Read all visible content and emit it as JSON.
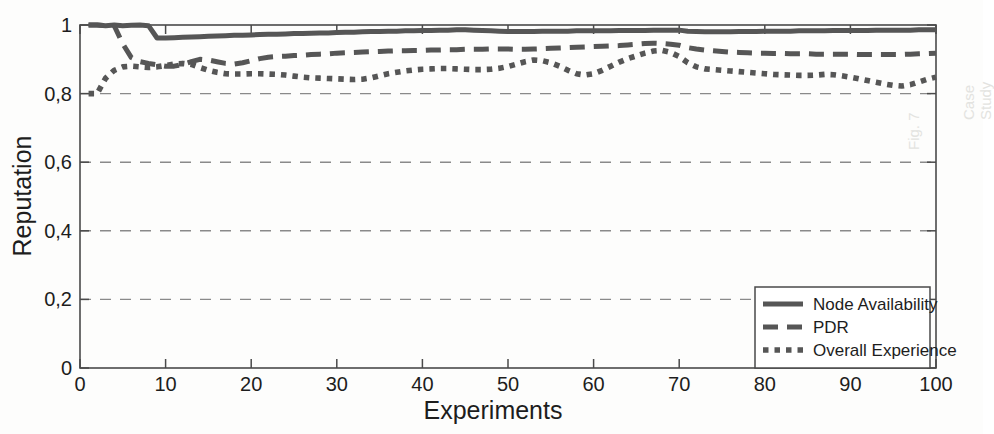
{
  "figure": {
    "background_color": "#fdfdfc",
    "axis_color": "#4a4a4a",
    "grid_color": "#8a8a8a",
    "series_color": "#565656"
  },
  "artifacts": [
    {
      "text": "Fig. 7",
      "x": 905,
      "y": 150
    },
    {
      "text": "Case Study",
      "x": 960,
      "y": 120
    }
  ],
  "chart_data": {
    "type": "line",
    "title": "",
    "xlabel": "Experiments",
    "ylabel": "Reputation",
    "xlim": [
      0,
      100
    ],
    "ylim": [
      0,
      1
    ],
    "grid": true,
    "grid_axis": "y",
    "grid_style": "dashed",
    "xticks": [
      0,
      10,
      20,
      30,
      40,
      50,
      60,
      70,
      80,
      90,
      100
    ],
    "xticklabels": [
      "0",
      "10",
      "20",
      "30",
      "40",
      "50",
      "60",
      "70",
      "80",
      "90",
      "100"
    ],
    "yticks": [
      0,
      0.2,
      0.4,
      0.6,
      0.8,
      1
    ],
    "yticklabels": [
      "0",
      "0,2",
      "0,4",
      "0,6",
      "0,8",
      "1"
    ],
    "legend_position": "lower right",
    "x": [
      1,
      2,
      3,
      4,
      5,
      6,
      7,
      8,
      9,
      10,
      11,
      12,
      13,
      14,
      15,
      16,
      17,
      18,
      19,
      20,
      21,
      22,
      23,
      24,
      25,
      26,
      27,
      28,
      29,
      30,
      31,
      32,
      33,
      34,
      35,
      36,
      37,
      38,
      39,
      40,
      41,
      42,
      43,
      44,
      45,
      46,
      47,
      48,
      49,
      50,
      51,
      52,
      53,
      54,
      55,
      56,
      57,
      58,
      59,
      60,
      61,
      62,
      63,
      64,
      65,
      66,
      67,
      68,
      69,
      70,
      71,
      72,
      73,
      74,
      75,
      76,
      77,
      78,
      79,
      80,
      81,
      82,
      83,
      84,
      85,
      86,
      87,
      88,
      89,
      90,
      91,
      92,
      93,
      94,
      95,
      96,
      97,
      98,
      99,
      100
    ],
    "series": [
      {
        "name": "Node Availability",
        "style": "solid",
        "values": [
          1.0,
          1.0,
          0.998,
          1.0,
          0.998,
          0.999,
          1.0,
          0.998,
          0.962,
          0.962,
          0.963,
          0.964,
          0.965,
          0.966,
          0.967,
          0.968,
          0.969,
          0.97,
          0.97,
          0.971,
          0.972,
          0.973,
          0.973,
          0.974,
          0.975,
          0.975,
          0.976,
          0.977,
          0.977,
          0.978,
          0.979,
          0.979,
          0.98,
          0.981,
          0.981,
          0.982,
          0.982,
          0.983,
          0.983,
          0.984,
          0.984,
          0.985,
          0.985,
          0.986,
          0.986,
          0.985,
          0.984,
          0.983,
          0.982,
          0.981,
          0.981,
          0.981,
          0.981,
          0.982,
          0.982,
          0.982,
          0.982,
          0.983,
          0.983,
          0.983,
          0.983,
          0.983,
          0.984,
          0.984,
          0.984,
          0.984,
          0.985,
          0.985,
          0.985,
          0.985,
          0.982,
          0.981,
          0.98,
          0.98,
          0.98,
          0.98,
          0.981,
          0.981,
          0.981,
          0.982,
          0.982,
          0.982,
          0.982,
          0.983,
          0.983,
          0.983,
          0.983,
          0.984,
          0.984,
          0.984,
          0.984,
          0.984,
          0.985,
          0.985,
          0.985,
          0.985,
          0.985,
          0.986,
          0.986,
          0.986
        ]
      },
      {
        "name": "PDR",
        "style": "dashed",
        "values": [
          1.0,
          1.0,
          0.998,
          0.998,
          0.945,
          0.905,
          0.893,
          0.888,
          0.884,
          0.88,
          0.88,
          0.885,
          0.893,
          0.9,
          0.898,
          0.893,
          0.888,
          0.886,
          0.89,
          0.896,
          0.902,
          0.906,
          0.908,
          0.909,
          0.911,
          0.912,
          0.914,
          0.915,
          0.916,
          0.918,
          0.919,
          0.92,
          0.921,
          0.922,
          0.923,
          0.924,
          0.925,
          0.925,
          0.926,
          0.926,
          0.927,
          0.927,
          0.928,
          0.928,
          0.929,
          0.929,
          0.929,
          0.93,
          0.93,
          0.93,
          0.929,
          0.929,
          0.93,
          0.931,
          0.932,
          0.933,
          0.934,
          0.935,
          0.936,
          0.937,
          0.938,
          0.939,
          0.94,
          0.942,
          0.944,
          0.946,
          0.947,
          0.946,
          0.944,
          0.941,
          0.934,
          0.93,
          0.927,
          0.925,
          0.923,
          0.921,
          0.92,
          0.919,
          0.918,
          0.918,
          0.917,
          0.917,
          0.916,
          0.916,
          0.916,
          0.915,
          0.915,
          0.915,
          0.915,
          0.915,
          0.914,
          0.914,
          0.914,
          0.914,
          0.914,
          0.914,
          0.915,
          0.916,
          0.917,
          0.918
        ]
      },
      {
        "name": "Overall Experience",
        "style": "dotted",
        "values": [
          0.8,
          0.8,
          0.845,
          0.868,
          0.878,
          0.88,
          0.878,
          0.876,
          0.878,
          0.882,
          0.886,
          0.888,
          0.885,
          0.876,
          0.868,
          0.862,
          0.858,
          0.857,
          0.857,
          0.858,
          0.858,
          0.857,
          0.856,
          0.854,
          0.851,
          0.848,
          0.846,
          0.845,
          0.844,
          0.843,
          0.842,
          0.841,
          0.842,
          0.846,
          0.852,
          0.858,
          0.862,
          0.866,
          0.869,
          0.871,
          0.872,
          0.873,
          0.873,
          0.872,
          0.871,
          0.87,
          0.87,
          0.871,
          0.874,
          0.879,
          0.886,
          0.893,
          0.898,
          0.896,
          0.89,
          0.88,
          0.868,
          0.858,
          0.854,
          0.858,
          0.868,
          0.88,
          0.892,
          0.902,
          0.91,
          0.918,
          0.924,
          0.926,
          0.92,
          0.908,
          0.89,
          0.878,
          0.872,
          0.87,
          0.868,
          0.866,
          0.864,
          0.862,
          0.86,
          0.858,
          0.856,
          0.855,
          0.854,
          0.853,
          0.853,
          0.854,
          0.856,
          0.855,
          0.852,
          0.848,
          0.843,
          0.838,
          0.833,
          0.828,
          0.824,
          0.822,
          0.826,
          0.834,
          0.842,
          0.848
        ]
      }
    ]
  }
}
